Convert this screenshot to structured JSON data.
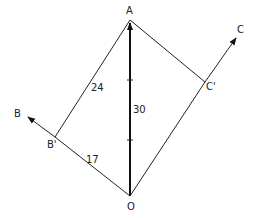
{
  "diagram": {
    "type": "vector-resolution",
    "points": {
      "A": {
        "label": "A",
        "x": 130,
        "y": 20
      },
      "O": {
        "label": "O",
        "x": 130,
        "y": 196
      },
      "B": {
        "label": "B",
        "x": 27,
        "y": 116
      },
      "B_prime": {
        "label": "B'",
        "x": 55,
        "y": 137
      },
      "C": {
        "label": "C",
        "x": 237,
        "y": 37
      },
      "C_prime": {
        "label": "C'",
        "x": 205,
        "y": 82
      }
    },
    "segments": [
      {
        "from": "O",
        "to": "A",
        "style": "bold-arrow",
        "label": "30",
        "ticks": 2
      },
      {
        "from": "B_prime",
        "to": "A",
        "style": "thin",
        "label": "24"
      },
      {
        "from": "O",
        "to": "B_prime",
        "style": "thin",
        "label": "17"
      },
      {
        "from": "B_prime",
        "to": "B",
        "style": "thin-arrow"
      },
      {
        "from": "A",
        "to": "C_prime",
        "style": "thin"
      },
      {
        "from": "O",
        "to": "C_prime",
        "style": "thin"
      },
      {
        "from": "C_prime",
        "to": "C",
        "style": "thin-arrow"
      }
    ],
    "labels": {
      "A": "A",
      "O": "O",
      "B": "B",
      "B_prime": "B'",
      "C": "C",
      "C_prime": "C'",
      "len_OA": "30",
      "len_BA": "24",
      "len_OB": "17"
    },
    "colors": {
      "line": "#222222",
      "background": "#ffffff"
    }
  }
}
